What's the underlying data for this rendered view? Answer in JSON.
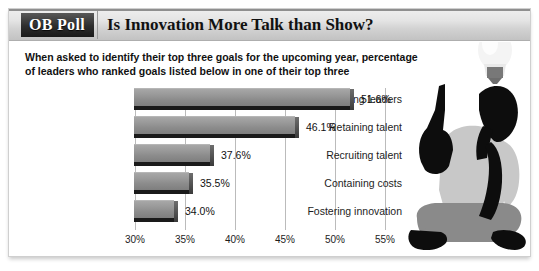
{
  "header": {
    "badge_label": "OB Poll",
    "title": "Is Innovation More Talk than Show?"
  },
  "body": {
    "question": "When asked to identify their top three goals for the upcoming year, percentage of leaders who ranked goals listed below in one of their top three"
  },
  "colors": {
    "badge_bg": "#1a1a1a",
    "bar_fill_light": "#a7a7a7",
    "bar_fill_dark": "#7e7e7e",
    "bar_shadow": "#1a1a1a",
    "gridline": "#bbbbbb",
    "text": "#1d1d1d",
    "card_border": "#cfcfcf",
    "illustration_shirt": "#c8c8c8",
    "illustration_pants": "#8a8a8a",
    "illustration_dark": "#0d0d0d",
    "bulb_glass": "#f2f2f2",
    "bulb_base": "#7a7a7a"
  },
  "illustration": {
    "bulb_icon": "lightbulb-icon",
    "person_icon": "seated-person-silhouette"
  },
  "chart_data": {
    "type": "bar",
    "orientation": "horizontal",
    "title": "Is Innovation More Talk than Show?",
    "subtitle": "When asked to identify their top three goals for the upcoming year, percentage of leaders who ranked goals listed below in one of their top three",
    "xlabel": "",
    "ylabel": "",
    "xlim": [
      30,
      55
    ],
    "grid": true,
    "gridlines_vertical": true,
    "legend": false,
    "tick_labels": [
      "30%",
      "35%",
      "40%",
      "45%",
      "50%",
      "55%"
    ],
    "ticks": [
      30,
      35,
      40,
      45,
      50,
      55
    ],
    "categories": [
      "Developing leaders",
      "Retaining talent",
      "Recruiting talent",
      "Containing costs",
      "Fostering innovation"
    ],
    "values": [
      51.6,
      46.1,
      37.6,
      35.5,
      34.0
    ],
    "value_labels": [
      "51.6%",
      "46.1%",
      "37.6%",
      "35.5%",
      "34.0%"
    ]
  }
}
